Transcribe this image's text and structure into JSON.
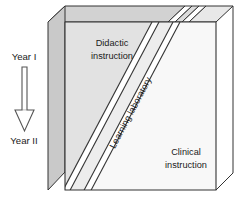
{
  "figure": {
    "background_color": "#ffffff"
  },
  "timeline": {
    "start_label": "Year I",
    "end_label": "Year II",
    "arrow_icon": "down-arrow-icon",
    "arrow_fill": "#ffffff",
    "arrow_stroke": "#555555"
  },
  "block": {
    "outline_color": "#333333",
    "slabs": [
      {
        "id": "didactic",
        "label_line1": "Didactic",
        "label_line2": "instruction",
        "face_color": "#e2e2e2",
        "top_color": "#d2d2d2",
        "side_color": "#c9c9c9"
      },
      {
        "id": "learning-laboratory",
        "label_line1": "Learning laboratory",
        "label_line2": "",
        "face_color": "#ededed",
        "top_color": "#dcdcdc",
        "side_color": "#d0d0d0"
      },
      {
        "id": "clinical",
        "label_line1": "Clinical",
        "label_line2": "instruction",
        "face_color": "#f8f8f8",
        "top_color": "#e8e8e8",
        "side_color": "#dadada"
      }
    ]
  }
}
